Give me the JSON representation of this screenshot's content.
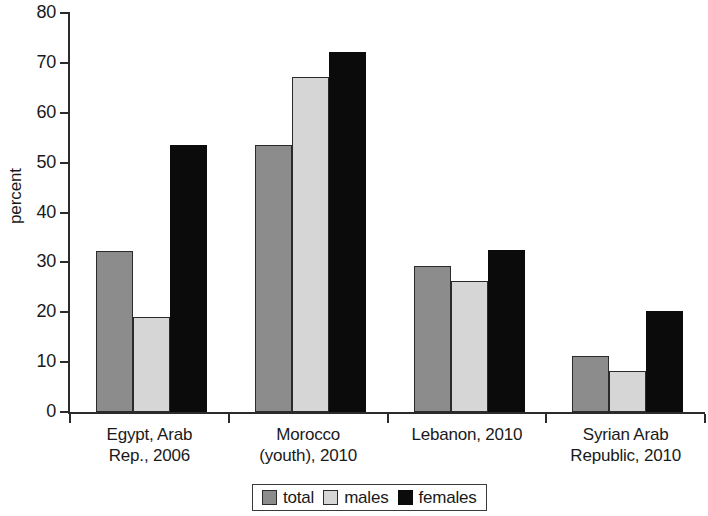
{
  "chart_data": {
    "type": "bar",
    "title": "",
    "xlabel": "",
    "ylabel": "percent",
    "ylim": [
      0,
      80
    ],
    "yticks": [
      0,
      10,
      20,
      30,
      40,
      50,
      60,
      70,
      80
    ],
    "grid": false,
    "legend_position": "bottom-center",
    "categories": [
      "Egypt, Arab Rep., 2006",
      "Morocco (youth), 2010",
      "Lebanon, 2010",
      "Syrian Arab Republic, 2010"
    ],
    "category_lines": [
      [
        "Egypt, Arab",
        "Rep., 2006"
      ],
      [
        "Morocco",
        "(youth), 2010"
      ],
      [
        "Lebanon, 2010"
      ],
      [
        "Syrian Arab",
        "Republic, 2010"
      ]
    ],
    "series": [
      {
        "name": "total",
        "color": "#8c8c8c",
        "values": [
          32.3,
          53.5,
          29.3,
          11.2
        ]
      },
      {
        "name": "males",
        "color": "#d6d6d6",
        "values": [
          19.0,
          67.2,
          26.3,
          8.3
        ]
      },
      {
        "name": "females",
        "color": "#0b0b0b",
        "values": [
          53.5,
          72.1,
          32.4,
          20.2
        ]
      }
    ]
  },
  "axis": {
    "ylabel": "percent",
    "tick_labels": [
      "80",
      "70",
      "60",
      "50",
      "40",
      "30",
      "20",
      "10",
      "0"
    ]
  },
  "legend": {
    "items": [
      {
        "label": "total",
        "color": "#8c8c8c"
      },
      {
        "label": "males",
        "color": "#d6d6d6"
      },
      {
        "label": "females",
        "color": "#0b0b0b"
      }
    ]
  }
}
